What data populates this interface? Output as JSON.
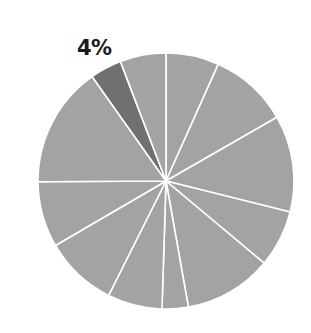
{
  "chart_data": {
    "type": "pie",
    "title": "",
    "start_angle_deg": 0,
    "direction": "clockwise",
    "slices": [
      {
        "value": 6.7,
        "color": "#a3a3a3",
        "highlighted": false
      },
      {
        "value": 10.0,
        "color": "#a3a3a3",
        "highlighted": false
      },
      {
        "value": 12.2,
        "color": "#a3a3a3",
        "highlighted": false
      },
      {
        "value": 7.2,
        "color": "#a3a3a3",
        "highlighted": false
      },
      {
        "value": 11.1,
        "color": "#a3a3a3",
        "highlighted": false
      },
      {
        "value": 3.3,
        "color": "#a3a3a3",
        "highlighted": false
      },
      {
        "value": 6.9,
        "color": "#a3a3a3",
        "highlighted": false
      },
      {
        "value": 9.2,
        "color": "#a3a3a3",
        "highlighted": false
      },
      {
        "value": 8.3,
        "color": "#a3a3a3",
        "highlighted": false
      },
      {
        "value": 15.3,
        "color": "#a3a3a3",
        "highlighted": false
      },
      {
        "value": 4.0,
        "color": "#707070",
        "highlighted": true,
        "label": "4%"
      },
      {
        "value": 5.8,
        "color": "#a3a3a3",
        "highlighted": false
      }
    ],
    "annotations": [
      "4%"
    ],
    "legend": null
  },
  "label": {
    "text": "4%"
  },
  "colors": {
    "slice": "#a3a3a3",
    "highlight": "#707070",
    "separator": "#ffffff"
  }
}
